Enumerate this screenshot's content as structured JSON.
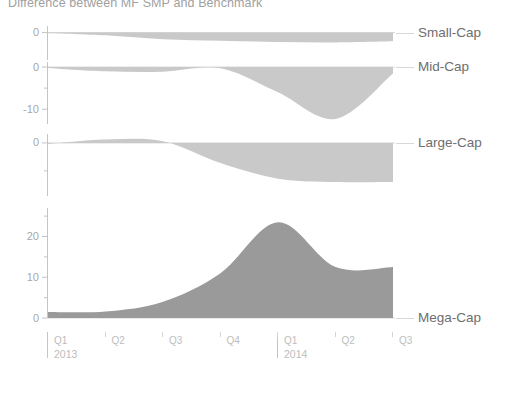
{
  "title": "Difference between MF SMP and Benchmark",
  "colors": {
    "light_fill": "#c9c9c9",
    "dark_fill": "#9a9a9a",
    "axis": "#c4c4c4",
    "tick_text": "#b6b6b6",
    "series_text": "#6e6e6e",
    "title_text": "#a0a0a0",
    "zero_line": "#d8d8d8"
  },
  "axis": {
    "x_quarters": [
      "Q1",
      "Q2",
      "Q3",
      "Q4",
      "Q1",
      "Q2",
      "Q3"
    ],
    "years": [
      "2013",
      "2014"
    ],
    "year_positions": [
      0,
      4
    ]
  },
  "chart_data": {
    "type": "area",
    "title": "Difference between MF SMP and Benchmark",
    "xlabel": "",
    "ylabel": "",
    "grid": false,
    "legend": "right",
    "x": [
      "Q1 2013",
      "Q2 2013",
      "Q3 2013",
      "Q4 2013",
      "Q1 2014",
      "Q2 2014",
      "Q3 2014"
    ],
    "panels": [
      {
        "name": "Small-Cap",
        "label": "Small-Cap",
        "fill": "#c9c9c9",
        "ylim": [
          -2.5,
          0.6
        ],
        "yticks": [
          0
        ],
        "yticklabels": [
          "0"
        ],
        "values": [
          -0.05,
          -0.25,
          -0.6,
          -0.75,
          -0.85,
          -0.9,
          -0.8
        ]
      },
      {
        "name": "Mid-Cap",
        "label": "Mid-Cap",
        "fill": "#c9c9c9",
        "ylim": [
          -13.5,
          1.2
        ],
        "yticks": [
          0,
          -10
        ],
        "yticklabels": [
          "0",
          "-10"
        ],
        "values": [
          -0.2,
          -1.0,
          -1.1,
          -0.3,
          -6.0,
          -12.3,
          -1.5
        ]
      },
      {
        "name": "Large-Cap",
        "label": "Large-Cap",
        "fill": "#c9c9c9",
        "ylim": [
          -9.5,
          1.6
        ],
        "yticks": [
          0,
          -10
        ],
        "yticklabels": [
          "0",
          "-10"
        ],
        "values": [
          -0.2,
          0.6,
          0.3,
          -3.6,
          -6.4,
          -7.0,
          -7.0
        ]
      },
      {
        "name": "Mega-Cap",
        "label": "Mega-Cap",
        "fill": "#9a9a9a",
        "ylim": [
          0,
          27
        ],
        "yticks": [
          0,
          10,
          20
        ],
        "yticklabels": [
          "0",
          "10",
          "20"
        ],
        "minor_yticks": [
          5,
          15,
          25
        ],
        "values": [
          1.5,
          1.6,
          4.0,
          11.0,
          23.5,
          12.5,
          12.5
        ]
      }
    ]
  }
}
